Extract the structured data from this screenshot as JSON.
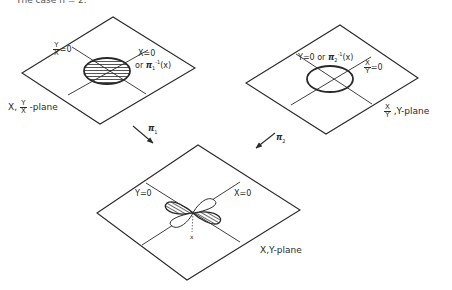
{
  "caption_fragment": "The case n = 2.",
  "planes": {
    "left": {
      "label_prefix": "X,",
      "label_frac_num": "Y",
      "label_frac_den": "X",
      "label_suffix": "-plane",
      "line1_frac_num": "Y",
      "line1_frac_den": "X",
      "line1_eq": "=0",
      "line2_text": "X=0",
      "line2_alt_prefix": "or",
      "line2_alt_map": "π",
      "line2_alt_sub": "1",
      "line2_alt_sup": "-1",
      "line2_alt_arg": "(x)",
      "ellipse_fill": "hatched"
    },
    "right": {
      "label_frac_num": "X",
      "label_frac_den": "Y",
      "label_suffix": ",Y-plane",
      "line1_text": "Y=0 or",
      "line1_map": "π",
      "line1_sub": "2",
      "line1_sup": "-1",
      "line1_arg": "(x)",
      "line2_frac_num": "X",
      "line2_frac_den": "Y",
      "line2_eq": "=0",
      "ellipse_fill": "none"
    },
    "bottom": {
      "label": "X,Y-plane",
      "line1_text": "Y=0",
      "line2_text": "X=0",
      "point_label": "x",
      "lobes": "four-leaf, two opposite lobes hatched"
    }
  },
  "arrows": {
    "left": {
      "map": "π",
      "sub": "1"
    },
    "right": {
      "map": "π",
      "sub": "2"
    }
  },
  "colors": {
    "ink": "#2a2a2a",
    "background": "#ffffff"
  }
}
